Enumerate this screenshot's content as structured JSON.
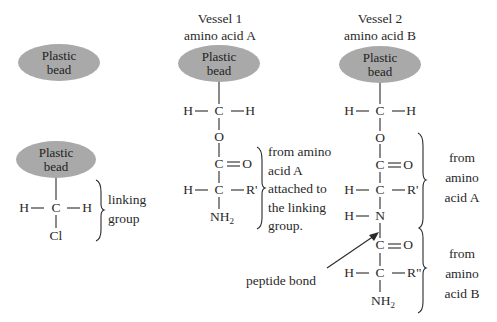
{
  "diagram": {
    "bead_label_line1": "Plastic",
    "bead_label_line2": "bead",
    "bead_color": "#a9a9a9",
    "panel1": {
      "bead": "Plastic bead"
    },
    "panel2": {
      "atoms": {
        "left_h": "H",
        "carbon": "C",
        "right_h": "H",
        "chlorine": "Cl"
      },
      "brace_label_line1": "linking",
      "brace_label_line2": "group"
    },
    "panel3": {
      "title_line1": "Vessel 1",
      "title_line2": "amino acid A",
      "atoms": {
        "ch2_left_h": "H",
        "ch2_carbon": "C",
        "ch2_right_h": "H",
        "oxygen": "O",
        "carbonyl_c": "C",
        "carbonyl_o": "O",
        "alpha_h": "H",
        "alpha_c": "C",
        "side_chain": "R'",
        "amine_n": "NH",
        "amine_sub": "2"
      },
      "brace_label": [
        "from amino",
        "acid A",
        "attached to",
        "the linking",
        "group."
      ]
    },
    "panel4": {
      "title_line1": "Vessel 2",
      "title_line2": "amino acid B",
      "atoms": {
        "ch2_left_h": "H",
        "ch2_carbon": "C",
        "ch2_right_h": "H",
        "oxygen": "O",
        "carbonyl_c": "C",
        "carbonyl_o": "O",
        "alpha_h": "H",
        "alpha_c": "C",
        "side_chain": "R'",
        "amide_h": "H",
        "amide_n": "N",
        "carbonyl2_c": "C",
        "carbonyl2_o": "O",
        "alpha2_h": "H",
        "alpha2_c": "C",
        "side_chain2": "R\"",
        "amine_n": "NH",
        "amine_sub": "2"
      },
      "brace_a_label": [
        "from",
        "amino",
        "acid A"
      ],
      "brace_b_label": [
        "from",
        "amino",
        "acid B"
      ],
      "arrow_label": "peptide bond"
    }
  }
}
